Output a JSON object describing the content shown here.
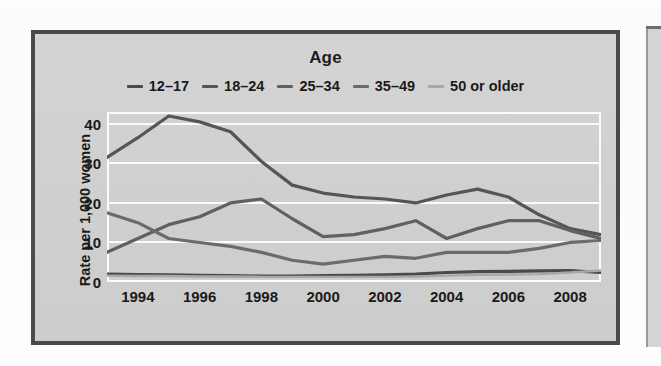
{
  "figure": {
    "title": "Age",
    "y_axis_title": "Rate per 1,000 women",
    "y_ticks": [
      "40",
      "30",
      "20",
      "10",
      "0"
    ],
    "x_ticks": [
      "1994",
      "1996",
      "1998",
      "2000",
      "2002",
      "2004",
      "2006",
      "2008"
    ]
  },
  "legend": {
    "position": "top-center",
    "items": [
      {
        "label": "12–17",
        "color": "#4a4a4a"
      },
      {
        "label": "18–24",
        "color": "#555555"
      },
      {
        "label": "25–34",
        "color": "#606060"
      },
      {
        "label": "35–49",
        "color": "#6b6b6b"
      },
      {
        "label": "50 or older",
        "color": "#a8a8a8"
      }
    ]
  },
  "colors": {
    "frame_border": "#4a4a4a",
    "chart_background": "#d2d2d2",
    "gridline": "#fbfbfb",
    "text": "#1a1a1a"
  },
  "chart_data": {
    "type": "line",
    "title": "Age",
    "xlabel": "",
    "ylabel": "Rate per 1,000 women",
    "xlim": [
      1993,
      2009
    ],
    "ylim": [
      0,
      43
    ],
    "yticks": [
      0,
      10,
      20,
      30,
      40
    ],
    "xticks": [
      1994,
      1996,
      1998,
      2000,
      2002,
      2004,
      2006,
      2008
    ],
    "grid": true,
    "legend_position": "top-center",
    "x": [
      1993,
      1994,
      1995,
      1996,
      1997,
      1998,
      1999,
      2000,
      2001,
      2002,
      2003,
      2004,
      2005,
      2006,
      2007,
      2008,
      2009
    ],
    "series": [
      {
        "name": "12–17",
        "color": "#4a4a4a",
        "values": [
          2.0,
          1.9,
          1.8,
          1.7,
          1.6,
          1.5,
          1.5,
          1.6,
          1.7,
          1.8,
          2.0,
          2.4,
          2.6,
          2.7,
          2.8,
          2.9,
          2.4
        ]
      },
      {
        "name": "18–24",
        "color": "#555555",
        "values": [
          31.5,
          36.5,
          42.0,
          40.5,
          38.0,
          30.5,
          24.5,
          22.5,
          21.5,
          21.0,
          20.0,
          22.0,
          23.5,
          21.5,
          17.0,
          13.5,
          12.0
        ]
      },
      {
        "name": "25–34",
        "color": "#606060",
        "values": [
          7.5,
          11.0,
          14.5,
          16.5,
          20.0,
          21.0,
          16.0,
          11.5,
          12.0,
          13.5,
          15.5,
          11.0,
          13.5,
          15.5,
          15.5,
          13.0,
          11.0
        ]
      },
      {
        "name": "35–49",
        "color": "#6b6b6b",
        "values": [
          17.5,
          15.0,
          11.0,
          10.0,
          9.0,
          7.5,
          5.5,
          4.5,
          5.5,
          6.5,
          6.0,
          7.5,
          7.5,
          7.5,
          8.5,
          10.0,
          10.5
        ]
      },
      {
        "name": "50 or older",
        "color": "#a8a8a8",
        "values": [
          1.6,
          1.5,
          1.5,
          1.4,
          1.4,
          1.3,
          1.3,
          1.3,
          1.3,
          1.3,
          1.4,
          1.6,
          1.8,
          1.9,
          2.0,
          2.4,
          2.9
        ]
      }
    ]
  }
}
